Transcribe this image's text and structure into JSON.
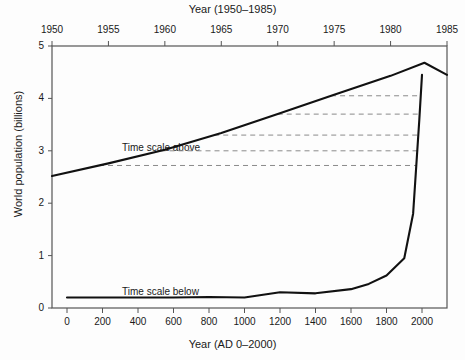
{
  "chart_data": {
    "type": "line",
    "title": "",
    "top_axis": {
      "label": "Year (1950–1985)",
      "ticks": [
        1950,
        1955,
        1960,
        1965,
        1970,
        1975,
        1980,
        1985
      ],
      "tick_labels": [
        "1950",
        "1955",
        "1960",
        "1965",
        "1970",
        "1975",
        "1980",
        "1985"
      ],
      "range": [
        1950,
        1985
      ]
    },
    "bottom_axis": {
      "label": "Year (AD 0–2000)",
      "ticks": [
        0,
        200,
        400,
        600,
        800,
        1000,
        1200,
        1400,
        1600,
        1800,
        2000
      ],
      "tick_labels": [
        "0",
        "200",
        "400",
        "600",
        "800",
        "1000",
        "1200",
        "1400",
        "1600",
        "1800",
        "2000"
      ],
      "range": [
        0,
        2000
      ]
    },
    "yaxis": {
      "label": "World population (billions)",
      "ticks": [
        0,
        1,
        2,
        3,
        4,
        5
      ],
      "tick_labels": [
        "0",
        "1",
        "2",
        "3",
        "4",
        "5"
      ],
      "ylim": [
        0,
        5
      ]
    },
    "grid": false,
    "legend": "none",
    "annotations": [
      {
        "text": "Time scale above",
        "x_px": 122,
        "y_px": 142
      },
      {
        "text": "Time scale below",
        "x_px": 122,
        "y_px": 286
      }
    ],
    "series": [
      {
        "name": "Time scale above",
        "axis": "top",
        "x": [
          1950,
          1955,
          1960,
          1965,
          1970,
          1975,
          1980,
          1983,
          1985
        ],
        "values": [
          2.52,
          2.76,
          3.02,
          3.34,
          3.7,
          4.07,
          4.43,
          4.68,
          4.45
        ]
      },
      {
        "name": "Time scale below",
        "axis": "bottom",
        "x": [
          0,
          200,
          400,
          600,
          800,
          1000,
          1200,
          1400,
          1600,
          1700,
          1800,
          1900,
          1950,
          1985,
          2000
        ],
        "values": [
          0.2,
          0.2,
          0.2,
          0.2,
          0.21,
          0.2,
          0.3,
          0.28,
          0.36,
          0.46,
          0.62,
          0.95,
          1.8,
          3.6,
          4.45
        ]
      }
    ],
    "connectors": {
      "description": "dashed horizontal lines linking the upper (expanded) curve to the lower (full-history) curve",
      "levels": [
        2.25,
        2.72,
        3.0,
        3.3,
        3.7,
        4.05
      ]
    }
  },
  "annotations": {
    "above": "Time scale above",
    "below": "Time scale below"
  },
  "colors": {
    "background": "#fdfdfd",
    "line": "#111111",
    "axis": "#555555",
    "dash": "#8a8a8a",
    "text": "#1a1a1a"
  }
}
